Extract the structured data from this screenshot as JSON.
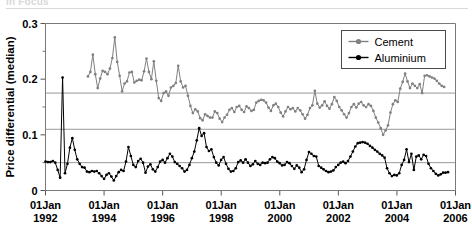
{
  "figure": {
    "cut_off_header": "In Focus",
    "background_color": "#ffffff"
  },
  "chart_data": {
    "type": "line",
    "title": "",
    "xlabel": "",
    "ylabel": "Price differential (median)",
    "ylim": [
      0,
      0.3
    ],
    "yticks": [
      0,
      0.1,
      0.2,
      0.3
    ],
    "ytick_labels": [
      "0",
      "0.1",
      "0.2",
      "0.3"
    ],
    "y_minor_ticks": [
      0.05,
      0.15,
      0.25
    ],
    "gridlines": [
      0.05,
      0.11,
      0.175
    ],
    "grid": true,
    "grid_color": "#9a9a9a",
    "xlim": [
      "1992-01-01",
      "2006-01-01"
    ],
    "xticks": [
      "1992-01-01",
      "1994-01-01",
      "1996-01-01",
      "1998-01-01",
      "2000-01-01",
      "2002-01-01",
      "2004-01-01",
      "2006-01-01"
    ],
    "xtick_labels": [
      [
        "01Jan",
        "1992"
      ],
      [
        "01Jan",
        "1994"
      ],
      [
        "01Jan",
        "1996"
      ],
      [
        "01Jan",
        "1998"
      ],
      [
        "01Jan",
        "2000"
      ],
      [
        "01Jan",
        "2002"
      ],
      [
        "01Jan",
        "2004"
      ],
      [
        "01Jan",
        "2006"
      ]
    ],
    "legend_position": "top-right",
    "legend": [
      "Cement",
      "Aluminium"
    ],
    "series": [
      {
        "name": "Cement",
        "color": "#808080",
        "marker": "circle",
        "x_start": 1993.45,
        "x_step": 0.0833,
        "values": [
          0.205,
          0.213,
          0.244,
          0.209,
          0.184,
          0.201,
          0.215,
          0.213,
          0.209,
          0.219,
          0.238,
          0.275,
          0.231,
          0.206,
          0.178,
          0.192,
          0.196,
          0.212,
          0.213,
          0.194,
          0.197,
          0.199,
          0.198,
          0.214,
          0.237,
          0.213,
          0.2,
          0.232,
          0.197,
          0.166,
          0.161,
          0.175,
          0.178,
          0.17,
          0.185,
          0.188,
          0.193,
          0.224,
          0.196,
          0.185,
          0.188,
          0.17,
          0.152,
          0.139,
          0.146,
          0.142,
          0.13,
          0.126,
          0.137,
          0.134,
          0.131,
          0.131,
          0.142,
          0.139,
          0.129,
          0.123,
          0.131,
          0.136,
          0.145,
          0.148,
          0.141,
          0.15,
          0.152,
          0.145,
          0.141,
          0.151,
          0.148,
          0.143,
          0.145,
          0.158,
          0.161,
          0.163,
          0.162,
          0.158,
          0.149,
          0.143,
          0.153,
          0.156,
          0.15,
          0.14,
          0.133,
          0.142,
          0.15,
          0.146,
          0.148,
          0.142,
          0.148,
          0.144,
          0.137,
          0.129,
          0.136,
          0.148,
          0.153,
          0.179,
          0.156,
          0.149,
          0.153,
          0.16,
          0.152,
          0.147,
          0.155,
          0.168,
          0.161,
          0.15,
          0.144,
          0.137,
          0.131,
          0.139,
          0.15,
          0.155,
          0.149,
          0.156,
          0.159,
          0.153,
          0.15,
          0.155,
          0.152,
          0.143,
          0.131,
          0.122,
          0.112,
          0.1,
          0.108,
          0.117,
          0.14,
          0.155,
          0.162,
          0.159,
          0.183,
          0.195,
          0.21,
          0.196,
          0.184,
          0.192,
          0.188,
          0.184,
          0.191,
          0.175,
          0.206,
          0.207,
          0.205,
          0.203,
          0.201,
          0.197,
          0.192,
          0.188,
          0.186
        ]
      },
      {
        "name": "Aluminium",
        "color": "#000000",
        "marker": "circle",
        "x_start": 1992.0,
        "x_step": 0.0833,
        "values": [
          0.052,
          0.051,
          0.051,
          0.053,
          0.05,
          0.037,
          0.023,
          0.203,
          0.031,
          0.048,
          0.077,
          0.094,
          0.073,
          0.056,
          0.048,
          0.042,
          0.041,
          0.034,
          0.033,
          0.035,
          0.034,
          0.035,
          0.031,
          0.026,
          0.021,
          0.028,
          0.031,
          0.025,
          0.018,
          0.026,
          0.033,
          0.037,
          0.035,
          0.052,
          0.078,
          0.062,
          0.046,
          0.042,
          0.053,
          0.057,
          0.05,
          0.032,
          0.043,
          0.047,
          0.038,
          0.034,
          0.042,
          0.052,
          0.055,
          0.05,
          0.058,
          0.066,
          0.061,
          0.051,
          0.048,
          0.044,
          0.04,
          0.034,
          0.037,
          0.046,
          0.058,
          0.07,
          0.09,
          0.112,
          0.098,
          0.103,
          0.078,
          0.071,
          0.074,
          0.06,
          0.05,
          0.045,
          0.055,
          0.06,
          0.048,
          0.039,
          0.034,
          0.035,
          0.04,
          0.051,
          0.054,
          0.05,
          0.056,
          0.05,
          0.044,
          0.047,
          0.053,
          0.048,
          0.046,
          0.05,
          0.049,
          0.05,
          0.056,
          0.06,
          0.058,
          0.052,
          0.049,
          0.045,
          0.046,
          0.051,
          0.049,
          0.044,
          0.039,
          0.045,
          0.041,
          0.033,
          0.038,
          0.055,
          0.069,
          0.066,
          0.062,
          0.061,
          0.044,
          0.041,
          0.038,
          0.035,
          0.033,
          0.034,
          0.036,
          0.042,
          0.046,
          0.05,
          0.052,
          0.049,
          0.053,
          0.061,
          0.07,
          0.079,
          0.085,
          0.086,
          0.087,
          0.086,
          0.084,
          0.08,
          0.077,
          0.073,
          0.07,
          0.066,
          0.063,
          0.059,
          0.04,
          0.031,
          0.026,
          0.028,
          0.027,
          0.031,
          0.046,
          0.055,
          0.074,
          0.051,
          0.066,
          0.037,
          0.061,
          0.063,
          0.056,
          0.064,
          0.062,
          0.048,
          0.04,
          0.035,
          0.03,
          0.027,
          0.029,
          0.032,
          0.032,
          0.033
        ]
      }
    ]
  }
}
